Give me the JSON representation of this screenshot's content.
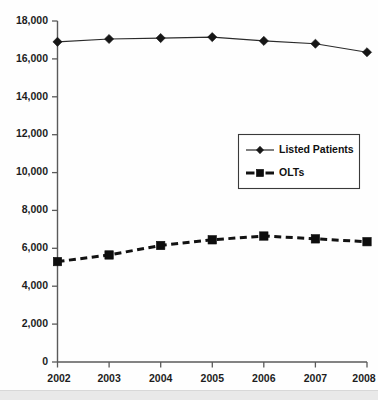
{
  "chart_data": {
    "type": "line",
    "title": "",
    "subtitle": "",
    "xlabel": "",
    "ylabel": "",
    "categories": [
      "2002",
      "2003",
      "2004",
      "2005",
      "2006",
      "2007",
      "2008"
    ],
    "x": [
      2002,
      2003,
      2004,
      2005,
      2006,
      2007,
      2008
    ],
    "series": [
      {
        "name": "Listed Patients",
        "marker": "diamond",
        "line_style": "solid",
        "color": "#1a1a1a",
        "values": [
          16900,
          17050,
          17100,
          17150,
          16950,
          16800,
          16350
        ]
      },
      {
        "name": "OLTs",
        "marker": "square",
        "line_style": "dashed",
        "color": "#0d0d0d",
        "values": [
          5300,
          5650,
          6150,
          6450,
          6650,
          6500,
          6350
        ]
      }
    ],
    "ylim": [
      0,
      18000
    ],
    "xlim": [
      2002,
      2008
    ],
    "yticks": [
      0,
      2000,
      4000,
      6000,
      8000,
      10000,
      12000,
      14000,
      16000,
      18000
    ],
    "ytick_labels": [
      "0",
      "2,000",
      "4,000",
      "6,000",
      "8,000",
      "10,000",
      "12,000",
      "14,000",
      "16,000",
      "18,000"
    ],
    "xtick_labels": [
      "2002",
      "2003",
      "2004",
      "2005",
      "2006",
      "2007",
      "2008"
    ],
    "grid": false,
    "legend_position": "center-right",
    "legend_entries": [
      "Listed Patients",
      "OLTs"
    ]
  },
  "legend": {
    "items": [
      {
        "label": "Listed Patients",
        "icon": "line-diamond-marker-icon"
      },
      {
        "label": "OLTs",
        "icon": "line-square-marker-icon"
      }
    ]
  },
  "axes": {
    "y_axis_name": "value-axis",
    "x_axis_name": "year-axis"
  }
}
